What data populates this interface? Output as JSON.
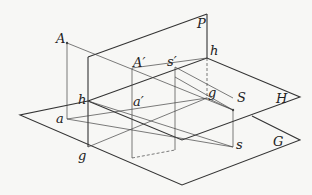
{
  "diagram": {
    "type": "descriptive-geometry projection",
    "planes": [
      {
        "id": "P",
        "label": "P",
        "kind": "vertical picture plane"
      },
      {
        "id": "H",
        "label": "H",
        "kind": "horizon plane"
      },
      {
        "id": "G",
        "label": "G",
        "kind": "ground plane"
      }
    ],
    "points": {
      "A": "A",
      "a": "a",
      "A_prime": "A′",
      "a_prime": "a′",
      "s_prime": "s′",
      "S": "S",
      "s": "s",
      "h_left": "h",
      "h_right": "h",
      "g_left": "g",
      "g_right": "g"
    }
  }
}
